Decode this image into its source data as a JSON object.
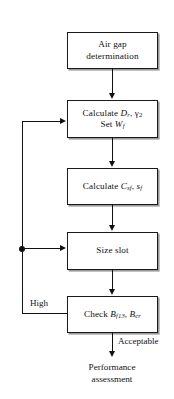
{
  "diagram": {
    "ink_color": "#111111",
    "shadow_color": "#9a9a9a",
    "background": "#ffffff"
  },
  "nodes": {
    "air_gap": {
      "line1": "Air gap",
      "line2": "determination"
    },
    "calculate_dr": {
      "line1_prefix": "Calculate ",
      "line1_var1": "D",
      "line1_var1_sub": "r",
      "line1_sep": ", ",
      "line1_var2": "γ",
      "line1_var2_sub": "2",
      "line2_prefix": "Set ",
      "line2_var": "W",
      "line2_sub": "f"
    },
    "calculate_csf": {
      "prefix": "Calculate ",
      "var1": "C",
      "var1_sub": "sf",
      "sep": ", ",
      "var2": "s",
      "var2_sub": "f"
    },
    "size_slot": {
      "label": "Size slot"
    },
    "check_b": {
      "prefix": "Check ",
      "var1": "B",
      "var1_sub": "f13",
      "sep": ", ",
      "var2": "B",
      "var2_sub": "cr"
    },
    "performance": {
      "line1": "Performance",
      "line2": "assessment"
    }
  },
  "edge_labels": {
    "high": "High",
    "acceptable": "Acceptable"
  }
}
